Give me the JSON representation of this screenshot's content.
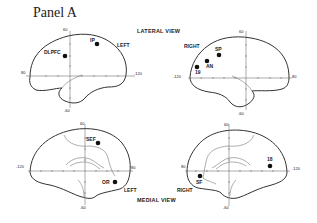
{
  "title": "Panel A",
  "views": {
    "lateral_label": "LATERAL VIEW",
    "medial_label": "MEDIAL VIEW"
  },
  "panels": {
    "lateral_left": {
      "hemisphere": "LEFT",
      "ticks": {
        "top": "60",
        "bottom": "-60",
        "left": "80",
        "right": "-120"
      },
      "points": [
        {
          "label": "DLPFC"
        },
        {
          "label": "IP"
        }
      ]
    },
    "lateral_right": {
      "hemisphere": "RIGHT",
      "ticks": {
        "top": "60",
        "bottom": "-60",
        "left": "-120",
        "right": "80"
      },
      "points": [
        {
          "label": "SP"
        },
        {
          "label": "AN"
        },
        {
          "label": "19"
        }
      ]
    },
    "medial_left": {
      "hemisphere": "LEFT",
      "ticks": {
        "top": "60",
        "bottom": "-60",
        "left": "-120",
        "right": "80"
      },
      "points": [
        {
          "label": "SEF"
        },
        {
          "label": "OR"
        }
      ]
    },
    "medial_right": {
      "hemisphere": "RIGHT",
      "ticks": {
        "top": "60",
        "bottom": "-60",
        "left": "80",
        "right": "-120"
      },
      "points": [
        {
          "label": "SF"
        },
        {
          "label": "18"
        }
      ]
    }
  }
}
